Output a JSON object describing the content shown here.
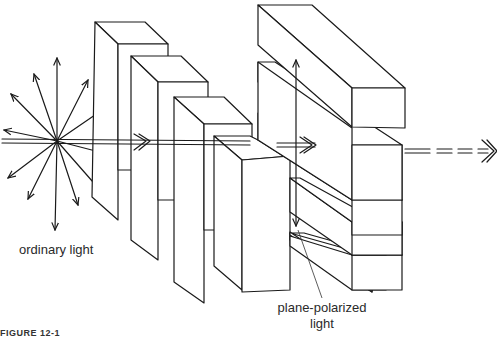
{
  "diagram": {
    "labels": {
      "ordinary_light": "ordinary light",
      "plane_polarized_line1": "plane-polarized",
      "plane_polarized_line2": "light"
    },
    "caption_fragment": "FIGURE 12-1",
    "elements": {
      "light_source": "ordinary light rays radiating in all directions",
      "first_polarizer": "vertical slats (4 blocks, stepped in depth)",
      "second_polarizer": "horizontal slats (4 blocks stacked)",
      "transmitted_beam": "double-line arrow to the right, dashed after exit"
    },
    "colors": {
      "line": "#1a1a1a",
      "background": "#ffffff",
      "text": "#2a2a2a"
    }
  }
}
